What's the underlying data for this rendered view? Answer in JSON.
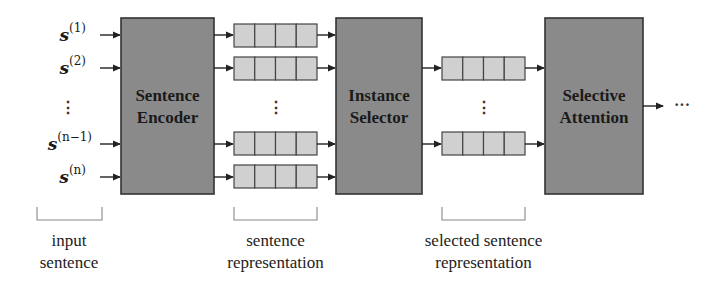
{
  "diagram": {
    "type": "pipeline",
    "inputs": {
      "labels": [
        {
          "base": "s",
          "sup": "(1)"
        },
        {
          "base": "s",
          "sup": "(2)"
        },
        {
          "base": "s",
          "sup": "(n−1)"
        },
        {
          "base": "s",
          "sup": "(n)"
        }
      ],
      "ellipsis": "⋮"
    },
    "blocks": {
      "encoder": {
        "line1": "Sentence",
        "line2": "Encoder"
      },
      "selector": {
        "line1": "Instance",
        "line2": "Selector"
      },
      "attention": {
        "line1": "Selective",
        "line2": "Attention"
      }
    },
    "representation_ellipsis": "⋮",
    "selected_ellipsis": "⋮",
    "output_ellipsis": "···",
    "captions": {
      "input": {
        "line1": "input",
        "line2": "sentence"
      },
      "representation": {
        "line1": "sentence",
        "line2": "representation"
      },
      "selected": {
        "line1": "selected sentence",
        "line2": "representation"
      }
    },
    "colors": {
      "block_fill": "#8a8a8a",
      "cell_fill": "#d0d0d0",
      "stroke": "#333333"
    }
  }
}
